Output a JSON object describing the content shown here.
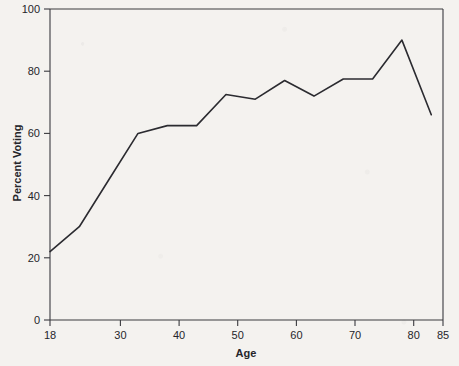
{
  "chart_data": {
    "type": "line",
    "title": "",
    "xlabel": "Age",
    "ylabel": "Percent Voting",
    "xlim": [
      18,
      85
    ],
    "ylim": [
      0,
      100
    ],
    "grid": false,
    "legend": null,
    "xticks": [
      18,
      30,
      40,
      50,
      60,
      70,
      80,
      85
    ],
    "xtick_labels": [
      "18",
      "30",
      "40",
      "50",
      "60",
      "70",
      "80",
      "85"
    ],
    "yticks": [
      0,
      20,
      40,
      60,
      80,
      100
    ],
    "ytick_labels": [
      "0",
      "20",
      "40",
      "60",
      "80",
      "100"
    ],
    "line_color": "#2b2b30",
    "series": [
      {
        "name": "Percent Voting",
        "x": [
          18,
          23,
          28,
          33,
          38,
          43,
          48,
          53,
          58,
          63,
          68,
          73,
          78,
          83
        ],
        "values": [
          22,
          30,
          45,
          60,
          62.5,
          62.5,
          72.5,
          71,
          77,
          72,
          77.5,
          77.5,
          90,
          66
        ]
      }
    ]
  },
  "axis": {
    "x_title": "Age",
    "y_title": "Percent Voting"
  }
}
